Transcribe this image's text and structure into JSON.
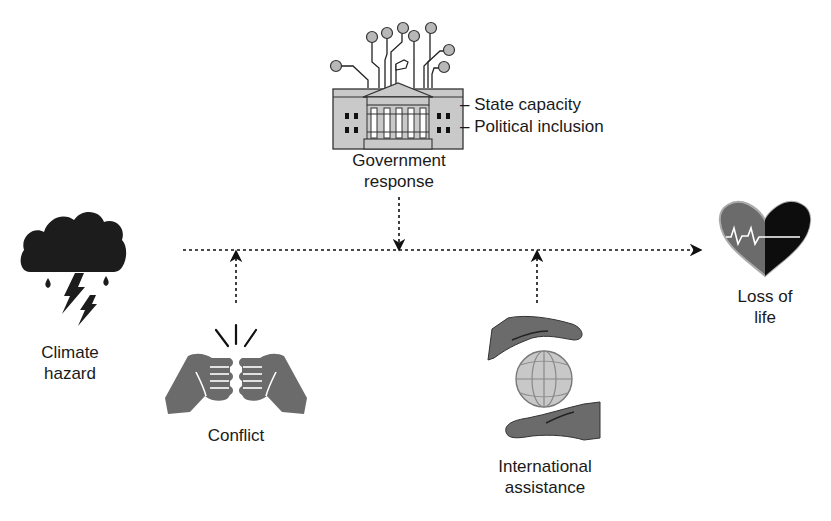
{
  "diagram": {
    "nodes": {
      "government": {
        "label_line1": "Government",
        "label_line2": "response",
        "attributes": [
          "– State capacity",
          "– Political inclusion"
        ],
        "icon": "government-building-icon"
      },
      "climate": {
        "label_line1": "Climate",
        "label_line2": "hazard",
        "icon": "storm-cloud-icon"
      },
      "conflict": {
        "label_line1": "Conflict",
        "icon": "fist-bump-icon"
      },
      "international": {
        "label_line1": "International",
        "label_line2": "assistance",
        "icon": "hands-globe-icon"
      },
      "loss": {
        "label_line1": "Loss of",
        "label_line2": "life",
        "icon": "heart-pulse-icon"
      }
    },
    "edges": [
      {
        "from": "climate",
        "to": "loss",
        "style": "dotted",
        "kind": "main-pathway"
      },
      {
        "from": "government",
        "to": "main-pathway",
        "style": "dotted",
        "kind": "moderator"
      },
      {
        "from": "conflict",
        "to": "main-pathway",
        "style": "dotted",
        "kind": "moderator"
      },
      {
        "from": "international",
        "to": "main-pathway",
        "style": "dotted",
        "kind": "moderator"
      }
    ],
    "colors": {
      "ink": "#111111",
      "icon_gray": "#6b6b6b",
      "light_gray": "#b8b8b8",
      "building_fill": "#c9c9c9"
    }
  }
}
